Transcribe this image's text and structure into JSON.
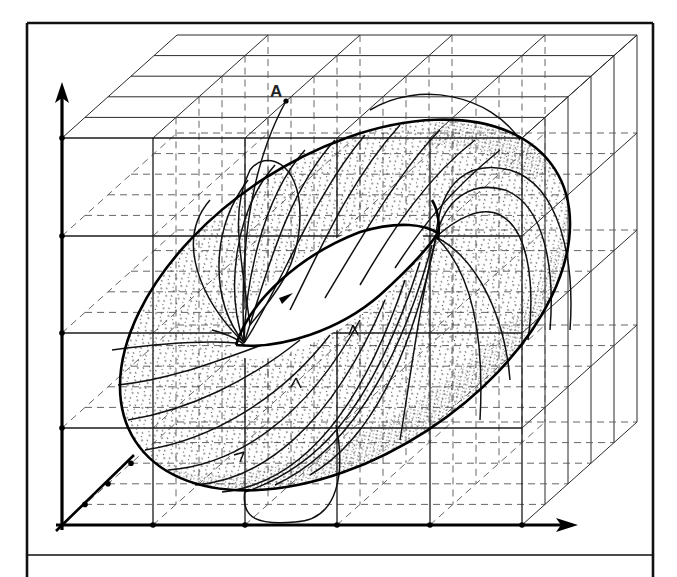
{
  "figure": {
    "point_label": "A",
    "colors": {
      "ink": "#000000",
      "paper": "#ffffff",
      "grid": "#1a1a1a",
      "stipple": "#333333"
    }
  },
  "frame": {
    "left": 27,
    "top": 23,
    "right": 653,
    "separator_y": 555,
    "bottom": 577
  },
  "axes": {
    "origin": [
      62,
      525
    ],
    "vertical_tip": [
      62,
      88
    ],
    "horizontal_tip": [
      574,
      525
    ],
    "depth_end": [
      134,
      455
    ],
    "vertical_ticks_y": [
      428,
      333,
      236,
      138
    ],
    "horizontal_ticks_x": [
      153,
      245,
      337,
      430,
      522
    ]
  },
  "grid": {
    "front_x": [
      62,
      153,
      245,
      337,
      430,
      522
    ],
    "front_y": [
      138,
      236,
      333,
      428,
      525
    ],
    "depth_layers": 5,
    "depth_step": [
      23,
      -20.6
    ]
  },
  "torus": {
    "outer_ellipse": {
      "cx": 345,
      "cy": 305,
      "rx": 250,
      "ry": 150,
      "rotate": -33
    },
    "inner_hole": {
      "cx": 338,
      "cy": 280,
      "rx": 112,
      "ry": 40,
      "rotate": -33
    },
    "point_A": [
      286,
      101
    ]
  }
}
